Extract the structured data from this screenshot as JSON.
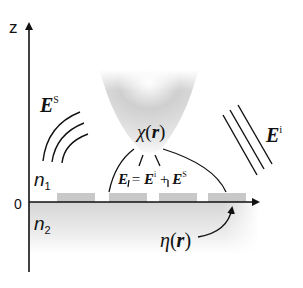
{
  "axes": {
    "z_label": "z",
    "origin_label": "0"
  },
  "labels": {
    "scattered_field": "E",
    "scattered_sup": "S",
    "incident_field": "E",
    "incident_sup": "i",
    "susceptibility": "χ(r)",
    "susceptibility_symbol": "χ",
    "susceptibility_arg": "r",
    "total_field_equation": {
      "lhs": "E",
      "eq": " = ",
      "t1": "E",
      "t1_sup": "i",
      "plus": " + ",
      "t2": "E",
      "t2_sup": "S"
    },
    "medium_1": "n",
    "medium_1_sub": "1",
    "medium_2": "n",
    "medium_2_sub": "2",
    "surface_profile_symbol": "η",
    "surface_profile_arg": "r"
  },
  "colors": {
    "ink": "#111111",
    "substrate": "#d9d9d9",
    "surface_features": "#c4c4c4",
    "probe": "#bdbdbd"
  }
}
